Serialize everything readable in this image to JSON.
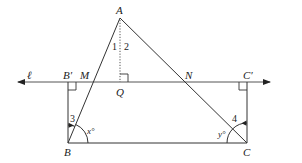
{
  "figure": {
    "points": {
      "A": {
        "label": "A",
        "x": 120,
        "y": 18
      },
      "B": {
        "label": "B",
        "x": 68,
        "y": 143
      },
      "C": {
        "label": "C",
        "x": 247,
        "y": 143
      },
      "B_prime": {
        "label": "B′",
        "x": 68,
        "y": 82
      },
      "C_prime": {
        "label": "C′",
        "x": 247,
        "y": 82
      },
      "M": {
        "label": "M",
        "x": 93,
        "y": 82
      },
      "N": {
        "label": "N",
        "x": 185,
        "y": 82
      },
      "Q": {
        "label": "Q",
        "x": 120,
        "y": 82
      }
    },
    "line": {
      "label": "ℓ",
      "x_start": 16,
      "x_end": 272,
      "y": 82
    },
    "angle_labels": {
      "angle1": "1",
      "angle2": "2",
      "angle3": "3",
      "angle4": "4",
      "angle_x": "x°",
      "angle_y": "y°"
    },
    "colors": {
      "stroke": "#333333",
      "text": "#222222",
      "background": "#ffffff"
    }
  }
}
